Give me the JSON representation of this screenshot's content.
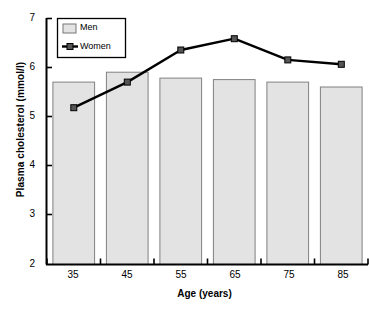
{
  "chart_data": {
    "type": "bar",
    "title": "",
    "xlabel": "Age (years)",
    "ylabel": "Plasma cholesterol (mmol/l)",
    "categories": [
      "35",
      "45",
      "55",
      "65",
      "75",
      "85"
    ],
    "ylim": [
      2,
      7
    ],
    "yticks": [
      "2",
      "3",
      "4",
      "5",
      "6",
      "7"
    ],
    "grid": false,
    "legend_position": "top-left",
    "series": [
      {
        "name": "Men",
        "type": "bar",
        "color": "#e3e3e3",
        "edge_color": "#808080",
        "values": [
          5.7,
          5.9,
          5.78,
          5.75,
          5.7,
          5.6
        ]
      },
      {
        "name": "Women",
        "type": "line",
        "color": "#000000",
        "marker": "square",
        "marker_color": "#555555",
        "values": [
          5.18,
          5.7,
          6.35,
          6.58,
          6.15,
          6.06
        ]
      }
    ]
  },
  "legend": {
    "men_label": "Men",
    "women_label": "Women"
  },
  "axes": {
    "y_title": "Plasma cholesterol (mmol/l)",
    "x_title": "Age (years)"
  }
}
